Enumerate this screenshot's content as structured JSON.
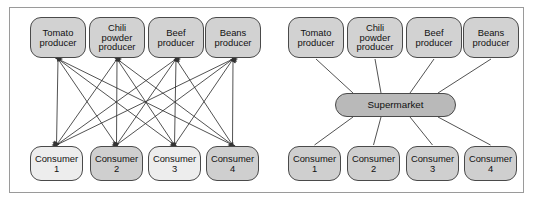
{
  "figure": {
    "panels": [
      {
        "id": "left",
        "topology": "complete-bipartite",
        "edge_style": "double-headed-arrows",
        "producers": [
          {
            "id": "tomato",
            "label": "Tomato\nproducer",
            "x": 30,
            "y": 17,
            "fill": "#d2d2d2"
          },
          {
            "id": "chili",
            "label": "Chili\npowder\nproducer",
            "x": 89,
            "y": 17,
            "fill": "#d2d2d2"
          },
          {
            "id": "beef",
            "label": "Beef\nproducer",
            "x": 148,
            "y": 17,
            "fill": "#d2d2d2"
          },
          {
            "id": "beans",
            "label": "Beans\nproducer",
            "x": 205,
            "y": 17,
            "fill": "#d2d2d2"
          }
        ],
        "consumers": [
          {
            "id": "c1",
            "label": "Consumer\n1",
            "x": 30,
            "y": 146,
            "fill": "#ededed"
          },
          {
            "id": "c2",
            "label": "Consumer\n2",
            "x": 90,
            "y": 146,
            "fill": "#cfcfcf"
          },
          {
            "id": "c3",
            "label": "Consumer\n3",
            "x": 148,
            "y": 146,
            "fill": "#ededed"
          },
          {
            "id": "c4",
            "label": "Consumer\n4",
            "x": 206,
            "y": 146,
            "fill": "#cfcfcf"
          }
        ]
      },
      {
        "id": "right",
        "topology": "star-hub",
        "edge_style": "plain-lines",
        "hub": {
          "id": "supermarket",
          "label": "Supermarket",
          "x": 335,
          "y": 93,
          "fill": "#b9b9b9"
        },
        "producers": [
          {
            "id": "tomato",
            "label": "Tomato\nproducer",
            "x": 288,
            "y": 17,
            "fill": "#d2d2d2"
          },
          {
            "id": "chili",
            "label": "Chili\npowder\nproducer",
            "x": 347,
            "y": 17,
            "fill": "#d2d2d2"
          },
          {
            "id": "beef",
            "label": "Beef\nproducer",
            "x": 406,
            "y": 17,
            "fill": "#d2d2d2"
          },
          {
            "id": "beans",
            "label": "Beans\nproducer",
            "x": 463,
            "y": 17,
            "fill": "#d2d2d2"
          }
        ],
        "consumers": [
          {
            "id": "c1",
            "label": "Consumer\n1",
            "x": 288,
            "y": 146,
            "fill": "#cfcfcf"
          },
          {
            "id": "c2",
            "label": "Consumer\n2",
            "x": 347,
            "y": 146,
            "fill": "#cfcfcf"
          },
          {
            "id": "c3",
            "label": "Consumer\n3",
            "x": 406,
            "y": 146,
            "fill": "#cfcfcf"
          },
          {
            "id": "c4",
            "label": "Consumer\n4",
            "x": 464,
            "y": 146,
            "fill": "#cfcfcf"
          }
        ]
      }
    ],
    "colors": {
      "frame_border": "#9a9a9a",
      "node_border": "#4a4a4a",
      "edge_line": "#333333",
      "producer_fill": "#d2d2d2",
      "consumer_fill": "#cfcfcf",
      "consumer_fill_light": "#ededed",
      "hub_fill": "#b9b9b9",
      "background": "#ffffff"
    }
  }
}
